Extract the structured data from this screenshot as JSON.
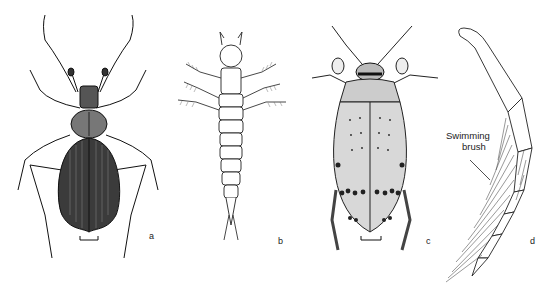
{
  "figure": {
    "panels": [
      {
        "id": "a",
        "label": "a",
        "subject": "ground/whirligig-type beetle adult, dorsal view, dark elytra",
        "scale_bar": true
      },
      {
        "id": "b",
        "label": "b",
        "subject": "segmented larva, dorsal view",
        "scale_bar": false
      },
      {
        "id": "c",
        "label": "c",
        "subject": "water beetle adult, dorsal view, spotted pale elytra",
        "scale_bar": true
      },
      {
        "id": "d",
        "label": "d",
        "subject": "hind leg with swimming brush",
        "scale_bar": false
      }
    ],
    "annotations": [
      {
        "panel": "d",
        "line1": "Swimming",
        "line2": "brush"
      }
    ]
  }
}
